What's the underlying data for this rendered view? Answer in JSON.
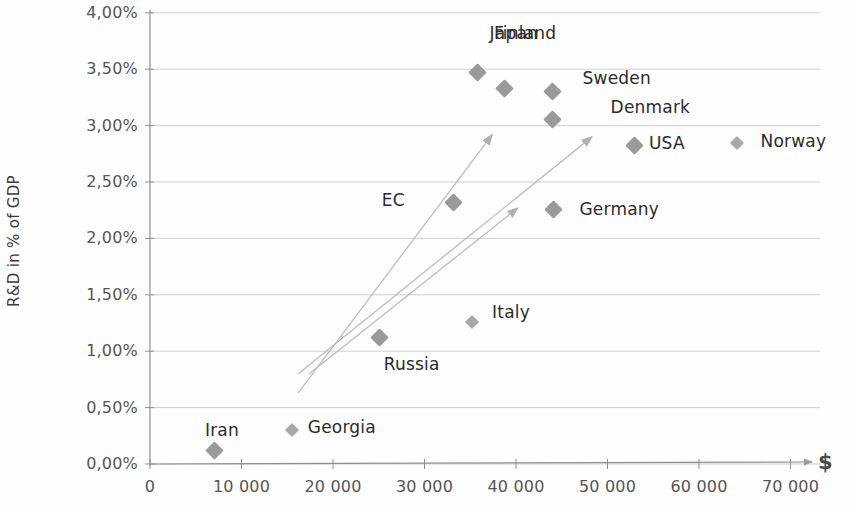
{
  "chart_data": {
    "type": "scatter",
    "title": "",
    "xlabel": "$",
    "ylabel": "R&D in % of GDP",
    "xlim": [
      0,
      72000
    ],
    "ylim": [
      0,
      4.0
    ],
    "grid": true,
    "legend": "none",
    "x_tick_labels": [
      "0",
      "10 000",
      "20 000",
      "30 000",
      "40 000",
      "50 000",
      "60 000",
      "70 000"
    ],
    "x_tick_values": [
      0,
      10000,
      20000,
      30000,
      40000,
      50000,
      60000,
      70000
    ],
    "y_tick_labels": [
      "0,00%",
      "0,50%",
      "1,00%",
      "1,50%",
      "2,00%",
      "2,50%",
      "3,00%",
      "3,50%",
      "4,00%"
    ],
    "y_tick_values": [
      0,
      0.5,
      1.0,
      1.5,
      2.0,
      2.5,
      3.0,
      3.5,
      4.0
    ],
    "points": [
      {
        "name": "Japan",
        "x": 35800,
        "y": 3.47
      },
      {
        "name": "Finland",
        "x": 38700,
        "y": 3.33
      },
      {
        "name": "Sweden",
        "x": 44000,
        "y": 3.3
      },
      {
        "name": "Denmark",
        "x": 44000,
        "y": 3.05
      },
      {
        "name": "USA",
        "x": 53000,
        "y": 2.82
      },
      {
        "name": "Norway",
        "x": 64100,
        "y": 2.85
      },
      {
        "name": "EC",
        "x": 33200,
        "y": 2.32
      },
      {
        "name": "Germany",
        "x": 44100,
        "y": 2.26
      },
      {
        "name": "Italy",
        "x": 35200,
        "y": 1.26
      },
      {
        "name": "Russia",
        "x": 25100,
        "y": 1.12
      },
      {
        "name": "Georgia",
        "x": 15500,
        "y": 0.3
      },
      {
        "name": "Iran",
        "x": 7100,
        "y": 0.12
      }
    ],
    "annotations": [
      {
        "type": "arrow",
        "label": "trend-arrow-1",
        "x1": 16200,
        "y1": 0.63,
        "x2": 37400,
        "y2": 2.92
      },
      {
        "type": "arrow",
        "label": "trend-arrow-2",
        "x1": 16200,
        "y1": 0.8,
        "x2": 48300,
        "y2": 2.9
      },
      {
        "type": "arrow",
        "label": "trend-arrow-3",
        "x1": 17400,
        "y1": 0.8,
        "x2": 40200,
        "y2": 2.27
      }
    ],
    "colors": {
      "marker": "#9a9a9a",
      "gridline": "#c9c9c9",
      "axis": "#8f8f8f",
      "text": "#2b2b2b",
      "tick_text": "#555555"
    }
  }
}
